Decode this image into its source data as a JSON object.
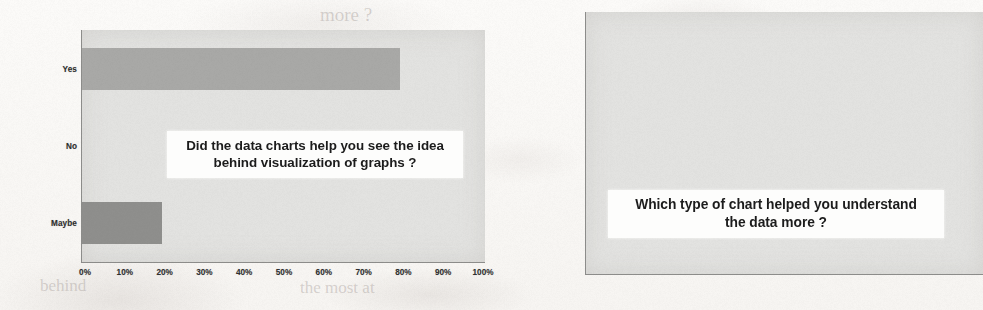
{
  "page": {
    "background_color": "#fbfaf8",
    "plot_area_color": "#e3e3e1",
    "axis_color": "#8d8d8b"
  },
  "chart_data": [
    {
      "type": "bar",
      "orientation": "horizontal",
      "id": "chart-left",
      "title": "Did the data charts help you see the idea behind visualization of graphs ?",
      "title_lines": [
        "Did the data charts help you see the idea",
        "behind visualization of graphs ?"
      ],
      "xlabel": "",
      "ylabel": "",
      "xlim": [
        0,
        100
      ],
      "grid": false,
      "legend": "none",
      "categories": [
        "Yes",
        "No",
        "Maybe"
      ],
      "values": [
        80,
        0,
        20
      ],
      "tick_labels": [
        "0%",
        "10%",
        "20%",
        "30%",
        "40%",
        "50%",
        "60%",
        "70%",
        "80%",
        "90%",
        "100%"
      ],
      "tick_values": [
        0,
        10,
        20,
        30,
        40,
        50,
        60,
        70,
        80,
        90,
        100
      ],
      "bar_colors": [
        "#a9a9a7",
        "#d8d8d6",
        "#8f8f8d"
      ]
    },
    {
      "type": "bar",
      "orientation": "horizontal",
      "id": "chart-right",
      "title": "Which type of chart helped you understand the data more ?",
      "title_lines": [
        "Which type of chart helped you understand",
        "the data more ?"
      ],
      "xlabel": "",
      "ylabel": "",
      "xlim": [
        0,
        100
      ],
      "grid": false,
      "legend": "none",
      "categories": [
        "Scatter Charts",
        "Column Charts",
        "Pie Charts",
        "Line Charts",
        "Combo Charts",
        "Table Charts"
      ],
      "values": [
        9,
        20,
        28,
        38,
        0,
        10
      ],
      "tick_labels": [
        "0%",
        "10%",
        "20%",
        "30%",
        "40%",
        "50%",
        "60%",
        "70%",
        "80%",
        "90%",
        "100%"
      ],
      "tick_values": [
        0,
        10,
        20,
        30,
        40,
        50,
        60,
        70,
        80,
        90,
        100
      ],
      "bar_colors": [
        "#b6b6b4",
        "#8c8c8a",
        "#a3a3a1",
        "#6e6e6c",
        "#d8d8d6",
        "#b2b2b0"
      ]
    }
  ],
  "ghost_text": {
    "left_mid": "Maybe",
    "bottom_left": "behind",
    "bottom_mid": "the most at",
    "top_right": "more ?"
  }
}
